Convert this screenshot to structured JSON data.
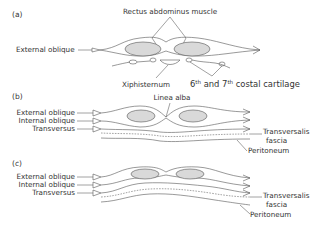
{
  "figure": {
    "panels": [
      {
        "id": "a",
        "label": "(a)",
        "labels": {
          "rectus": "Rectus abdominus muscle",
          "external_oblique": "External oblique",
          "xiphisternum": "Xiphisternum",
          "costal_cartilage_prefix1": "6",
          "costal_cartilage_sup1": "th",
          "costal_cartilage_mid": " and 7",
          "costal_cartilage_sup2": "th",
          "costal_cartilage_suffix": " costal cartilage"
        }
      },
      {
        "id": "b",
        "label": "(b)",
        "labels": {
          "linea_alba": "Linea alba",
          "external_oblique": "External oblique",
          "internal_oblique": "Internal oblique",
          "transversus": "Transversus",
          "transversalis": "Transversalis",
          "fascia": "fascia",
          "peritoneum": "Peritoneum"
        }
      },
      {
        "id": "c",
        "label": "(c)",
        "labels": {
          "external_oblique": "External oblique",
          "internal_oblique": "Internal oblique",
          "transversus": "Transversus",
          "transversalis": "Transversalis",
          "fascia": "fascia",
          "peritoneum": "Peritoneum"
        }
      }
    ]
  }
}
